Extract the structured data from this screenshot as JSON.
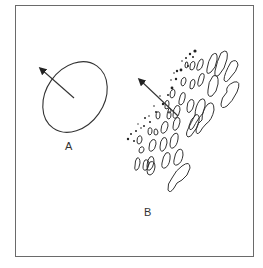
{
  "figure": {
    "panels": [
      {
        "id": "A",
        "label": "A",
        "description": "single tilted ellipse with arrow pointing up-left"
      },
      {
        "id": "B",
        "label": "B",
        "description": "array of tilted blob contours with arrow pointing up-left"
      }
    ],
    "colors": {
      "stroke": "#333333",
      "frame": "#6a6a6a",
      "background": "#ffffff"
    }
  }
}
